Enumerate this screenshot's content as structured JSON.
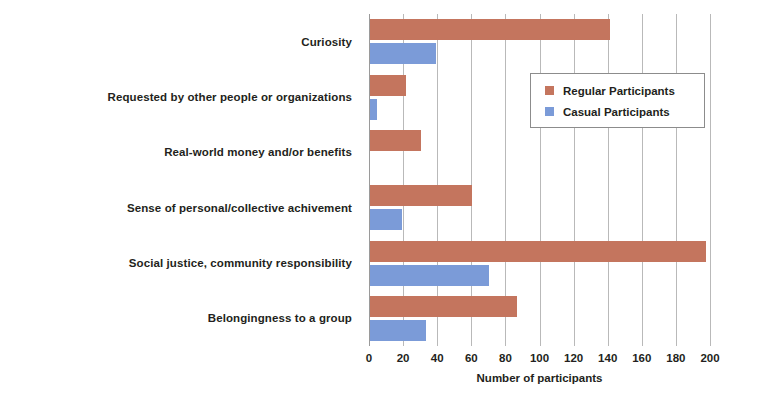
{
  "chart_data": {
    "type": "bar",
    "orientation": "horizontal",
    "title": "",
    "xlabel": "Number of participants",
    "ylabel": "",
    "xlim": [
      0,
      200
    ],
    "xticks": [
      0,
      20,
      40,
      60,
      80,
      100,
      120,
      140,
      160,
      180,
      200
    ],
    "xtick_labels": [
      "0",
      "20",
      "40",
      "60",
      "80",
      "100",
      "120",
      "140",
      "160",
      "180",
      "200"
    ],
    "grid": true,
    "legend_position": "upper right (inside plot)",
    "categories": [
      "Curiosity",
      "Requested by other people or organizations",
      "Real-world money and/or benefits",
      "Sense of personal/collective achivement",
      "Social justice, community responsibility",
      "Belongingness to a group"
    ],
    "series": [
      {
        "name": "Regular Participants",
        "color": "#c4755e",
        "values": [
          141,
          21,
          30,
          60,
          197,
          86
        ]
      },
      {
        "name": "Casual Participants",
        "color": "#7b9bd8",
        "values": [
          39,
          4,
          0,
          19,
          70,
          33
        ]
      }
    ]
  },
  "legend": {
    "items": [
      {
        "label": "Regular Participants",
        "swatch": "regular-swatch"
      },
      {
        "label": "Casual Participants",
        "swatch": "casual-swatch"
      }
    ]
  },
  "colors": {
    "regular": "#c4755e",
    "casual": "#7b9bd8",
    "grid": "#b9b9b9",
    "text": "#231f20",
    "background": "#ffffff"
  }
}
